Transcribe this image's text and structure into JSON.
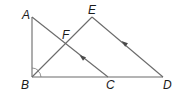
{
  "diagram": {
    "type": "geometry",
    "points": [
      {
        "id": "A",
        "label": "A",
        "x": 32,
        "y": 17,
        "lx": 22,
        "ly": 19
      },
      {
        "id": "B",
        "label": "B",
        "x": 32,
        "y": 77,
        "lx": 21,
        "ly": 89
      },
      {
        "id": "C",
        "label": "C",
        "x": 108,
        "y": 77,
        "lx": 106,
        "ly": 89
      },
      {
        "id": "D",
        "label": "D",
        "x": 163,
        "y": 77,
        "lx": 163,
        "ly": 89
      },
      {
        "id": "E",
        "label": "E",
        "x": 92,
        "y": 17,
        "lx": 88,
        "ly": 14
      },
      {
        "id": "F",
        "label": "F",
        "x": 65,
        "y": 44,
        "lx": 62,
        "ly": 39
      }
    ],
    "segments": [
      {
        "from": "A",
        "to": "B"
      },
      {
        "from": "B",
        "to": "D"
      },
      {
        "from": "A",
        "to": "C"
      },
      {
        "from": "B",
        "to": "E"
      },
      {
        "from": "E",
        "to": "D"
      }
    ],
    "parallel_marks": [
      {
        "segment": "AC",
        "direction": "C-to-A",
        "x": 82,
        "y": 57
      },
      {
        "segment": "ED",
        "direction": "D-to-E",
        "x": 124,
        "y": 43
      }
    ],
    "angle_marks": [
      {
        "vertex": "B",
        "between": [
          "A",
          "D"
        ],
        "style": "double-arc"
      }
    ],
    "colors": {
      "line": "#6a6a6a",
      "label": "#1a1a1a",
      "arrow": "#4a4a4a"
    }
  }
}
